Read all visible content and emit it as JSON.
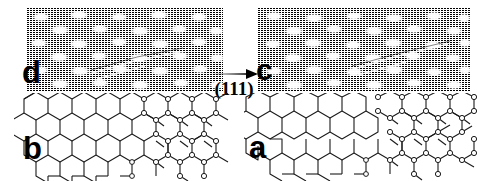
{
  "figure": {
    "type": "stm-micrograph-with-structural-model",
    "background_color": "#ffffff",
    "ink_color": "#000000"
  },
  "panels": [
    {
      "id": "d",
      "label": "d",
      "kind": "stm-image",
      "position": "top-left",
      "description": "halftone STM topograph with bright protrusions in a quasi-hexagonal array",
      "x": 27,
      "y": 8,
      "width": 196,
      "height": 84
    },
    {
      "id": "c",
      "label": "c",
      "kind": "stm-image",
      "position": "top-right",
      "description": "halftone STM topograph with bright protrusions in a quasi-hexagonal array",
      "x": 258,
      "y": 8,
      "width": 212,
      "height": 84
    },
    {
      "id": "b",
      "label": "b",
      "kind": "structural-model",
      "position": "bottom-left",
      "description": "honeycomb lattice turning into ball-and-stick reconstruction",
      "x": 14,
      "y": 93,
      "width": 215,
      "height": 88
    },
    {
      "id": "a",
      "label": "a",
      "kind": "structural-model",
      "position": "bottom-right",
      "description": "honeycomb lattice turning into ball-and-stick reconstruction",
      "x": 244,
      "y": 93,
      "width": 233,
      "height": 88
    }
  ],
  "annotation": {
    "arrow": {
      "name": "direction-arrow",
      "direction": "right",
      "length_px": 48
    },
    "crystal_direction": "(111)"
  },
  "lattice": {
    "hex_radius": 13,
    "bond_color": "#1a1a1a",
    "atom_fill": "#ffffff",
    "atom_stroke": "#1a1a1a"
  },
  "stm_texture": {
    "scanline_spacing": 2,
    "dot_spacing": 2,
    "bright_spot_color": "#ffffff",
    "dark_color": "#000000"
  }
}
